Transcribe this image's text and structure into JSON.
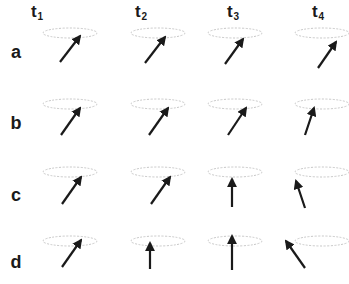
{
  "figure": {
    "columns": [
      {
        "label": "t",
        "sub": "1",
        "x": 37
      },
      {
        "label": "t",
        "sub": "2",
        "x": 141
      },
      {
        "label": "t",
        "sub": "3",
        "x": 233
      },
      {
        "label": "t",
        "sub": "4",
        "x": 318
      }
    ],
    "rows": [
      {
        "label": "a",
        "y": 52,
        "ellipse_y": 33
      },
      {
        "label": "b",
        "y": 123,
        "ellipse_y": 104
      },
      {
        "label": "c",
        "y": 195,
        "ellipse_y": 172
      },
      {
        "label": "d",
        "y": 262,
        "ellipse_y": 241
      }
    ],
    "ellipse_centers_x": [
      70,
      158,
      235,
      322
    ],
    "arrows": [
      [
        [
          60,
          62,
          80,
          36
        ],
        [
          145,
          63,
          165,
          37
        ],
        [
          225,
          64,
          243,
          39
        ],
        [
          318,
          68,
          336,
          42
        ]
      ],
      [
        [
          61,
          135,
          80,
          108
        ],
        [
          149,
          135,
          168,
          108
        ],
        [
          228,
          135,
          246,
          108
        ],
        [
          305,
          135,
          314,
          108
        ]
      ],
      [
        [
          62,
          204,
          81,
          177
        ],
        [
          151,
          204,
          170,
          177
        ],
        [
          232,
          207,
          232,
          179
        ],
        [
          305,
          208,
          296,
          181
        ]
      ],
      [
        [
          62,
          267,
          81,
          240
        ],
        [
          150,
          269,
          150,
          243
        ],
        [
          232,
          270,
          232,
          236
        ],
        [
          305,
          268,
          286,
          241
        ]
      ]
    ],
    "colors": {
      "arrow": "#1a1a1a",
      "ellipse": "#c8c8c8",
      "text": "#1a1a1a"
    }
  }
}
